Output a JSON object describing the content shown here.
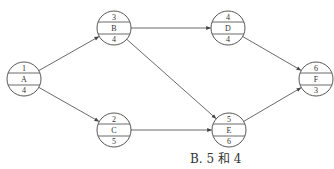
{
  "diagram": {
    "type": "activity-on-node network",
    "nodes": [
      {
        "id": "A",
        "top": "1",
        "label": "A",
        "bottom": "4",
        "cx": 24,
        "cy": 79
      },
      {
        "id": "B",
        "top": "3",
        "label": "B",
        "bottom": "4",
        "cx": 114,
        "cy": 28
      },
      {
        "id": "C",
        "top": "2",
        "label": "C",
        "bottom": "5",
        "cx": 114,
        "cy": 130
      },
      {
        "id": "D",
        "top": "4",
        "label": "D",
        "bottom": "4",
        "cx": 228,
        "cy": 28
      },
      {
        "id": "E",
        "top": "5",
        "label": "E",
        "bottom": "6",
        "cx": 229,
        "cy": 130
      },
      {
        "id": "F",
        "top": "6",
        "label": "F",
        "bottom": "3",
        "cx": 316,
        "cy": 79
      }
    ],
    "edges": [
      {
        "from": "A",
        "to": "B"
      },
      {
        "from": "A",
        "to": "C"
      },
      {
        "from": "B",
        "to": "D"
      },
      {
        "from": "B",
        "to": "E"
      },
      {
        "from": "C",
        "to": "E"
      },
      {
        "from": "D",
        "to": "F"
      },
      {
        "from": "E",
        "to": "F"
      }
    ],
    "caption": "B. 5 和 4",
    "colors": {
      "stroke": "#444444",
      "text": "#333333",
      "background": "#ffffff"
    }
  }
}
